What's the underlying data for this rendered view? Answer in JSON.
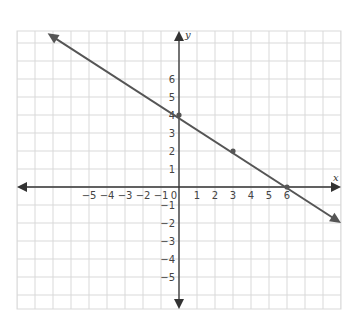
{
  "chart_data": {
    "type": "line",
    "title": "",
    "xlabel": "x",
    "ylabel": "y",
    "xlim": [
      -9,
      9
    ],
    "ylim": [
      -6.8,
      8.6
    ],
    "grid": true,
    "x_ticks": [
      -5,
      -4,
      -3,
      -2,
      -1,
      0,
      1,
      2,
      3,
      4,
      5,
      6
    ],
    "y_ticks": [
      6,
      5,
      4,
      3,
      2,
      1,
      -1,
      -2,
      -3,
      -4,
      -5
    ],
    "x_tick_labels": [
      "−5",
      "−4",
      "−3",
      "−2",
      "−1",
      "0",
      "1",
      "2",
      "3",
      "4",
      "5",
      "6"
    ],
    "y_tick_labels": [
      "6",
      "5",
      "4",
      "3",
      "2",
      "1",
      "−1",
      "−2",
      "−3",
      "−4",
      "−5"
    ],
    "series": [
      {
        "name": "line",
        "equation": "y = -2/3 x + 4",
        "slope": -0.6667,
        "intercept": 4,
        "x": [
          -7.3,
          9
        ],
        "y": [
          8.87,
          -2
        ],
        "arrows": "both"
      }
    ],
    "points": [
      {
        "x": 0,
        "y": 4
      },
      {
        "x": 3,
        "y": 2
      },
      {
        "x": 6,
        "y": 0
      }
    ]
  },
  "colors": {
    "grid": "#d9d9d9",
    "axis": "#333333",
    "line": "#555555",
    "point": "#555555"
  }
}
